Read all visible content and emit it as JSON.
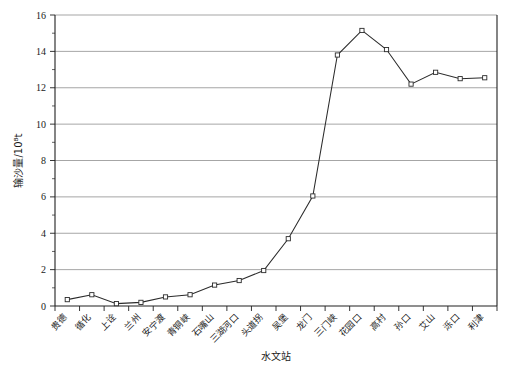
{
  "chart_data": {
    "type": "line",
    "title": "",
    "xlabel": "水文站",
    "ylabel": "输沙量/10⁸t",
    "ylim": [
      0,
      16
    ],
    "ytick_step": 2,
    "yticks": [
      0,
      2,
      4,
      6,
      8,
      10,
      12,
      14,
      16
    ],
    "ytick_labels": [
      "0",
      "2",
      "4",
      "6",
      "8",
      "10",
      "12",
      "14",
      "16"
    ],
    "grid": "horizontal",
    "legend": "none",
    "marker": "open-square",
    "line_color": "#2b2b2b",
    "marker_fill": "#ffffff",
    "grid_color": "#808080",
    "categories": [
      "贵德",
      "循化",
      "上诠",
      "兰州",
      "安宁渡",
      "青铜峡",
      "石嘴山",
      "三湖河口",
      "头道拐",
      "吴堡",
      "龙门",
      "三门峡",
      "花园口",
      "高村",
      "孙口",
      "艾山",
      "泺口",
      "利津"
    ],
    "values": [
      0.35,
      0.62,
      0.13,
      0.2,
      0.5,
      0.62,
      1.15,
      1.4,
      1.95,
      3.7,
      6.05,
      13.8,
      15.15,
      14.1,
      12.2,
      12.85,
      12.5,
      12.55
    ],
    "series": [
      {
        "name": "输沙量",
        "values": [
          0.35,
          0.62,
          0.13,
          0.2,
          0.5,
          0.62,
          1.15,
          1.4,
          1.95,
          3.7,
          6.05,
          13.8,
          15.15,
          14.1,
          12.2,
          12.85,
          12.5,
          12.55
        ]
      }
    ]
  }
}
